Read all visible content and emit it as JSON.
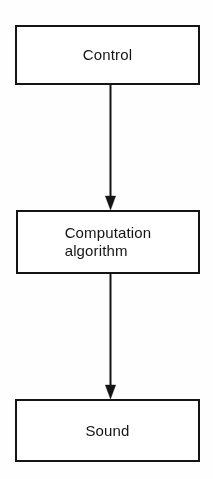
{
  "diagram": {
    "canvas": {
      "width": 213,
      "height": 479,
      "background": "#fefefe"
    },
    "style": {
      "stroke_color": "#141414",
      "text_color": "#151515",
      "box_fill": "#ffffff"
    },
    "nodes": [
      {
        "id": "control",
        "label": "Control",
        "shape": "rectangle",
        "x": 15,
        "y": 25,
        "width": 185,
        "height": 60
      },
      {
        "id": "computation",
        "label": "Computation\nalgorithm",
        "shape": "rectangle",
        "x": 16,
        "y": 210,
        "width": 184,
        "height": 64
      },
      {
        "id": "sound",
        "label": "Sound",
        "shape": "rectangle",
        "x": 15,
        "y": 399,
        "width": 185,
        "height": 63
      }
    ],
    "edges": [
      {
        "id": "control-to-computation",
        "from": "control",
        "to": "computation",
        "label": "",
        "arrowhead": "filled-triangle",
        "direction": "down"
      },
      {
        "id": "computation-to-sound",
        "from": "computation",
        "to": "sound",
        "label": "",
        "arrowhead": "filled-triangle",
        "direction": "down"
      }
    ]
  }
}
